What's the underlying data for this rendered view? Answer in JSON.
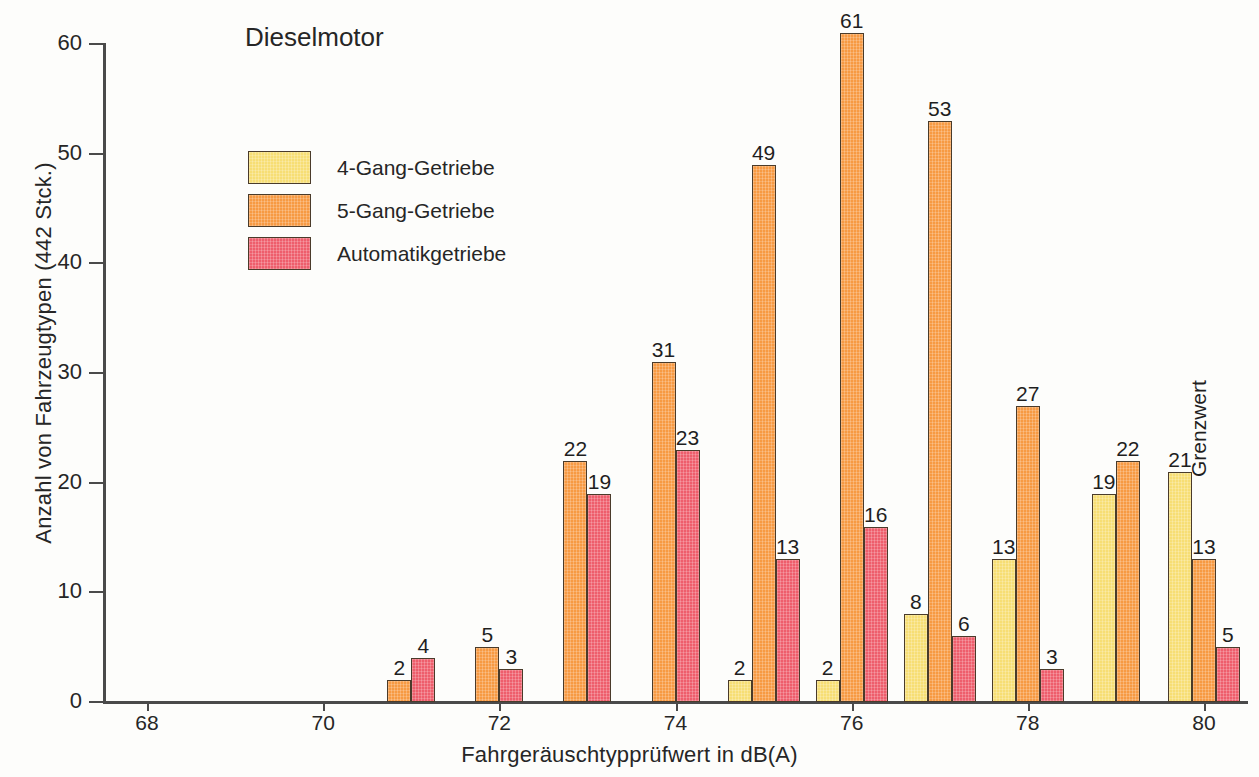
{
  "chart_data": {
    "type": "bar",
    "title": "Dieselmotor",
    "xlabel": "Fahrgeräuschtypprüfwert in dB(A)",
    "ylabel": "Anzahl von Fahrzeugtypen (442 Stck.)",
    "ylim": [
      0,
      60
    ],
    "yticks": [
      0,
      10,
      20,
      30,
      40,
      50,
      60
    ],
    "ytick_labels": [
      "0",
      "10",
      "20",
      "30",
      "40",
      "50",
      "60"
    ],
    "xlim": [
      67.5,
      80.5
    ],
    "xticks": [
      68,
      70,
      72,
      74,
      76,
      78,
      80
    ],
    "xtick_labels": [
      "68",
      "70",
      "72",
      "74",
      "76",
      "78",
      "80"
    ],
    "categories": [
      68,
      69,
      70,
      71,
      72,
      73,
      74,
      75,
      76,
      77,
      78,
      79,
      80
    ],
    "grid": false,
    "legend_position": "upper-left-inset",
    "series": [
      {
        "name": "4-Gang-Getriebe",
        "color": "#F7DE74",
        "values": [
          null,
          null,
          null,
          null,
          null,
          null,
          null,
          2,
          2,
          8,
          13,
          19,
          21
        ]
      },
      {
        "name": "5-Gang-Getriebe",
        "color": "#F79A43",
        "values": [
          null,
          null,
          null,
          2,
          5,
          22,
          31,
          49,
          61,
          53,
          27,
          22,
          13
        ]
      },
      {
        "name": "Automatikgetriebe",
        "color": "#EE5E6C",
        "values": [
          null,
          null,
          null,
          4,
          3,
          19,
          23,
          13,
          16,
          6,
          3,
          null,
          5
        ]
      }
    ],
    "annotations": [
      {
        "text": "Grenzwert",
        "x": 80,
        "rotation": -90
      }
    ]
  },
  "legend": {
    "items": [
      {
        "label": "4-Gang-Getriebe",
        "color": "#F7DE74"
      },
      {
        "label": "5-Gang-Getriebe",
        "color": "#F79A43"
      },
      {
        "label": "Automatikgetriebe",
        "color": "#EE5E6C"
      }
    ]
  }
}
